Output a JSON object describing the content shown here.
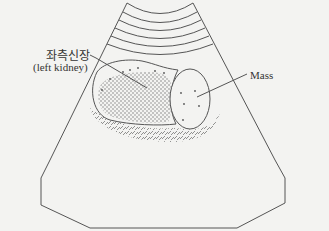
{
  "diagram": {
    "type": "ultrasound-illustration",
    "labels": {
      "kidney_korean": "좌측신장",
      "kidney_english": "(left kidney)",
      "mass": "Mass"
    },
    "colors": {
      "background": "#f3f3f1",
      "line": "#555555",
      "stipple": "#6a6a6a",
      "text": "#333333"
    }
  }
}
